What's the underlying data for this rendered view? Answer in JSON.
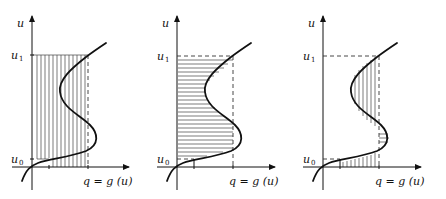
{
  "figure": {
    "panels": [
      {
        "id": "panel-1",
        "hatch": "vertical",
        "y_axis_label": "u",
        "upper_level": {
          "symbol": "u",
          "subscript": "1"
        },
        "lower_level": {
          "symbol": "u",
          "subscript": "0"
        },
        "x_axis_label": "q = g (u)"
      },
      {
        "id": "panel-2",
        "hatch": "horizontal",
        "y_axis_label": "u",
        "upper_level": {
          "symbol": "u",
          "subscript": "1"
        },
        "lower_level": {
          "symbol": "u",
          "subscript": "0"
        },
        "x_axis_label": "q = g (u)"
      },
      {
        "id": "panel-3",
        "hatch": "mixed",
        "y_axis_label": "u",
        "upper_level": {
          "symbol": "u",
          "subscript": "1"
        },
        "lower_level": {
          "symbol": "u",
          "subscript": "0"
        },
        "x_axis_label": "q = g (u)"
      }
    ]
  }
}
